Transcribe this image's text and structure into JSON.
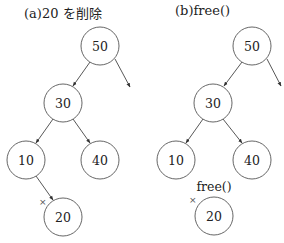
{
  "panels": [
    {
      "title": "(a)20 を削除",
      "nodes": [
        {
          "id": "50",
          "label": "50",
          "cx": 100,
          "cy": 46
        },
        {
          "id": "30",
          "label": "30",
          "cx": 63,
          "cy": 103
        },
        {
          "id": "10",
          "label": "10",
          "cx": 26,
          "cy": 160
        },
        {
          "id": "40",
          "label": "40",
          "cx": 100,
          "cy": 160
        },
        {
          "id": "20",
          "label": "20",
          "cx": 63,
          "cy": 217
        }
      ],
      "edges": [
        {
          "from": "50",
          "to": "30"
        },
        {
          "from": "50",
          "to": "right-subtree"
        },
        {
          "from": "30",
          "to": "10"
        },
        {
          "from": "30",
          "to": "40"
        },
        {
          "from": "10",
          "to": "20"
        }
      ],
      "deleted_mark": "×"
    },
    {
      "title": "(b)free()",
      "nodes": [
        {
          "id": "50",
          "label": "50",
          "cx": 252,
          "cy": 46
        },
        {
          "id": "30",
          "label": "30",
          "cx": 213,
          "cy": 103
        },
        {
          "id": "10",
          "label": "10",
          "cx": 176,
          "cy": 160
        },
        {
          "id": "40",
          "label": "40",
          "cx": 252,
          "cy": 160
        },
        {
          "id": "20",
          "label": "20",
          "cx": 214,
          "cy": 216
        }
      ],
      "edges": [
        {
          "from": "50",
          "to": "30"
        },
        {
          "from": "50",
          "to": "right-subtree"
        },
        {
          "from": "30",
          "to": "10"
        },
        {
          "from": "30",
          "to": "40"
        }
      ],
      "deleted_mark": "×",
      "free_label": "free()"
    }
  ]
}
